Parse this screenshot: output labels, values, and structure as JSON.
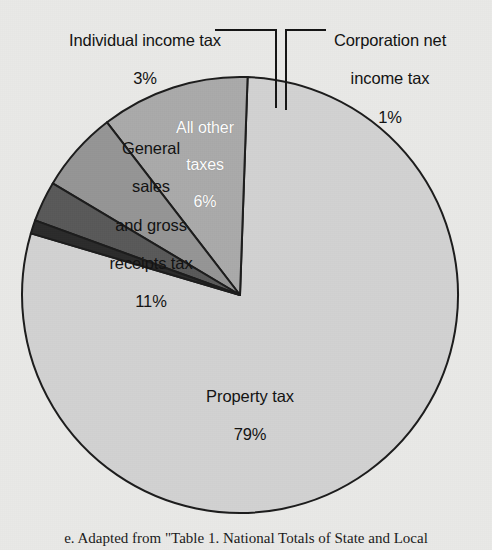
{
  "chart_data": {
    "type": "pie",
    "title": "",
    "subtitle": "",
    "xlabel": "",
    "ylabel": "",
    "legend_position": "none",
    "grid": false,
    "units": "percent",
    "categories": [
      "Property tax",
      "Corporation net income tax",
      "Individual income tax",
      "All other taxes",
      "General sales and gross receipts tax"
    ],
    "values": [
      79,
      1,
      3,
      6,
      11
    ],
    "slices": [
      {
        "label": "Property tax",
        "label_text": "Property tax",
        "value": 79,
        "value_text": "79%",
        "color": "#d2d2d2",
        "label_placement": "inside",
        "label_color": "#121212",
        "start_angle_deg": 2,
        "end_angle_deg": 286.4
      },
      {
        "label": "Corporation net income tax",
        "label_text": "Corporation net\nincome tax",
        "value": 1,
        "value_text": "1%",
        "color": "#2b2b2b",
        "label_placement": "outside-leader",
        "label_color": "#121212",
        "start_angle_deg": 286.4,
        "end_angle_deg": 290.0
      },
      {
        "label": "Individual income tax",
        "label_text": "Individual income tax",
        "value": 3,
        "value_text": "3%",
        "color": "#595959",
        "label_placement": "outside-leader",
        "label_color": "#121212",
        "start_angle_deg": 290.0,
        "end_angle_deg": 300.8
      },
      {
        "label": "All other taxes",
        "label_text": "All other\ntaxes",
        "value": 6,
        "value_text": "6%",
        "color": "#959595",
        "label_placement": "inside",
        "label_color": "#ffffff",
        "start_angle_deg": 300.8,
        "end_angle_deg": 322.4
      },
      {
        "label": "General sales and gross receipts tax",
        "label_text": "General\nsales\nand gross\nreceipts tax",
        "value": 11,
        "value_text": "11%",
        "color": "#aaaaaa",
        "label_placement": "inside",
        "label_color": "#121212",
        "start_angle_deg": 322.4,
        "end_angle_deg": 362.0
      }
    ]
  },
  "labels": {
    "individual": {
      "text": "Individual income tax",
      "percent": "3%"
    },
    "corporation": {
      "line1": "Corporation net",
      "line2": "income tax",
      "percent": "1%"
    },
    "allother": {
      "line1": "All other",
      "line2": "taxes",
      "percent": "6%"
    },
    "general": {
      "line1": "General",
      "line2": "sales",
      "line3": "and gross",
      "line4": "receipts tax",
      "percent": "11%"
    },
    "property": {
      "text": "Property tax",
      "percent": "79%"
    }
  },
  "caption": {
    "text": "e. Adapted from \"Table 1. National Totals of State and Local"
  },
  "colors": {
    "background": "#e9e9e7",
    "outline": "#1c1c1c",
    "property_tax": "#d2d2d2",
    "general_sales": "#aaaaaa",
    "all_other": "#959595",
    "individual_income": "#595959",
    "corporation_income": "#2b2b2b"
  }
}
